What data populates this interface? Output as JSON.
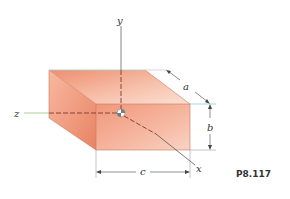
{
  "figure": {
    "problem_id": "P8.117",
    "axes": {
      "x": "x",
      "y": "y",
      "z": "z"
    },
    "dimensions": {
      "a": "a",
      "b": "b",
      "c": "c"
    },
    "colors": {
      "box_front": "#f2a58a",
      "box_top": "#f4b49c",
      "box_side": "#ec8e70",
      "edge": "#c46b52",
      "axis_line": "#555555",
      "z_axis": "#7fbf6a",
      "accent_line": "#6ab7c2"
    }
  }
}
